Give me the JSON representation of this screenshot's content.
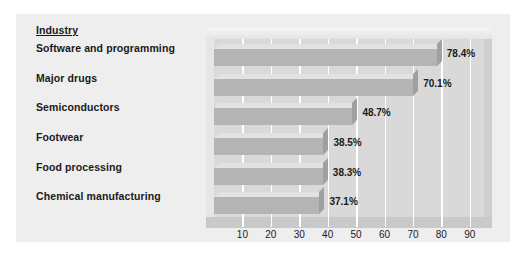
{
  "chart_data": {
    "type": "bar",
    "orientation": "horizontal",
    "title": "",
    "xlabel": "",
    "ylabel": "",
    "category_header": "Industry",
    "categories": [
      "Software and programming",
      "Major drugs",
      "Semiconductors",
      "Footwear",
      "Food processing",
      "Chemical manufacturing"
    ],
    "values": [
      78.4,
      70.1,
      48.7,
      38.5,
      38.3,
      37.1
    ],
    "value_labels": [
      "78.4%",
      "70.1%",
      "48.7%",
      "38.5%",
      "38.3%",
      "37.1%"
    ],
    "xlim": [
      0,
      95
    ],
    "xticks": [
      10,
      20,
      30,
      40,
      50,
      60,
      70,
      80,
      90
    ],
    "xtick_labels": [
      "10",
      "20",
      "30",
      "40",
      "50",
      "60",
      "70",
      "80",
      "90"
    ],
    "grid": true,
    "gridline_color": "#ffffff",
    "legend": null,
    "colors": {
      "bar_front": "#b4b4b4",
      "bar_top": "#e2e2e2",
      "bar_side": "#a0a0a0",
      "plot_background": "#d9d9d9",
      "panel_background": "#eeeeee",
      "figure_background": "#ffffff",
      "text": "#1a1a1a"
    }
  }
}
